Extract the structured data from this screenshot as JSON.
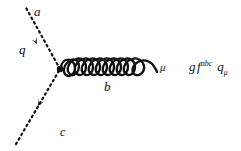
{
  "figure": {
    "background_color": "#ffffff",
    "ink_color": "#111111",
    "width": 241,
    "height": 151
  },
  "diagram": {
    "type": "feynman-diagram",
    "vertex": {
      "x": 60,
      "y": 69,
      "style": "filled-dot",
      "radius": 3
    },
    "lines": [
      {
        "name": "upper-fermion-line",
        "style": "dashed",
        "label_color": "a",
        "label_momentum": "q",
        "from": {
          "x": 60,
          "y": 69
        },
        "to": {
          "x": 25,
          "y": 6
        },
        "arrow": {
          "x": 37,
          "y": 44,
          "direction": "up-left"
        }
      },
      {
        "name": "lower-fermion-line",
        "style": "dashed",
        "label_color": "c",
        "from": {
          "x": 16,
          "y": 144
        },
        "to": {
          "x": 60,
          "y": 69
        },
        "arrow": {
          "x": 38,
          "y": 106,
          "direction": "up-right"
        }
      },
      {
        "name": "gluon-line",
        "style": "coil",
        "label_color": "b",
        "label_index": "μ",
        "from": {
          "x": 62,
          "y": 70
        },
        "to": {
          "x": 157,
          "y": 72
        },
        "loops": 5
      }
    ]
  },
  "labels": {
    "a": "a",
    "q": "q",
    "c": "c",
    "b": "b",
    "mu": "μ"
  },
  "formula": {
    "full_text": "g f abc q μ",
    "coupling": "g",
    "structure_constant_symbol": "f",
    "structure_constant_indices": "abc",
    "momentum_symbol": "q",
    "momentum_index": "μ"
  }
}
